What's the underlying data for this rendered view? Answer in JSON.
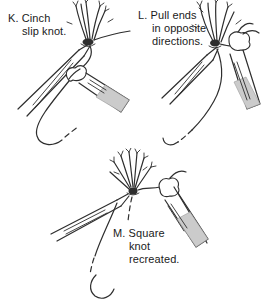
{
  "figure": {
    "type": "surgical-knot-tying-instruction-diagram",
    "background_color": "#ffffff",
    "line_color": "#2e2e2e",
    "shade_color": "#cbcbcb",
    "text_color": "#1a1a1a",
    "panels": [
      {
        "id": "K",
        "label": "K. Cinch\nslip knot."
      },
      {
        "id": "L",
        "label": "L. Pull ends\nin opposite\ndirections."
      },
      {
        "id": "M",
        "label": "M. Square\nknot\nrecreated."
      }
    ]
  }
}
